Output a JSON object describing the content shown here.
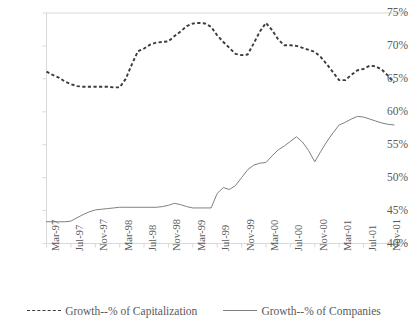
{
  "chart_data": {
    "type": "line",
    "title": "",
    "xlabel": "",
    "ylabel": "",
    "ylim": [
      40,
      75
    ],
    "ytick_labels": [
      "75%",
      "70%",
      "65%",
      "60%",
      "55%",
      "50%",
      "45%",
      "40%"
    ],
    "ytick_values": [
      75,
      70,
      65,
      60,
      55,
      50,
      45,
      40
    ],
    "grid": false,
    "legend_position": "bottom",
    "x": [
      "Mar-97",
      "Apr-97",
      "May-97",
      "Jun-97",
      "Jul-97",
      "Aug-97",
      "Sep-97",
      "Oct-97",
      "Nov-97",
      "Dec-97",
      "Jan-98",
      "Feb-98",
      "Mar-98",
      "Apr-98",
      "May-98",
      "Jun-98",
      "Jul-98",
      "Aug-98",
      "Sep-98",
      "Oct-98",
      "Nov-98",
      "Dec-98",
      "Jan-99",
      "Feb-99",
      "Mar-99",
      "Apr-99",
      "May-99",
      "Jun-99",
      "Jul-99",
      "Aug-99",
      "Sep-99",
      "Oct-99",
      "Nov-99",
      "Dec-99",
      "Jan-00",
      "Feb-00",
      "Mar-00",
      "Apr-00",
      "May-00",
      "Jun-00",
      "Jul-00",
      "Aug-00",
      "Sep-00",
      "Oct-00",
      "Nov-00",
      "Dec-00",
      "Jan-01",
      "Feb-01",
      "Mar-01",
      "Apr-01",
      "May-01",
      "Jun-01",
      "Jul-01",
      "Aug-01",
      "Sep-01",
      "Oct-01",
      "Nov-01",
      "Dec-01"
    ],
    "xtick_labels": [
      "Mar-97",
      "Jul-97",
      "Nov-97",
      "Mar-98",
      "Jul-98",
      "Nov-98",
      "Mar-99",
      "Jul-99",
      "Nov-99",
      "Mar-00",
      "Jul-00",
      "Nov-00",
      "Mar-01",
      "Jul-01",
      "Nov-01"
    ],
    "xtick_indices": [
      0,
      4,
      8,
      12,
      16,
      20,
      24,
      28,
      32,
      36,
      40,
      44,
      48,
      52,
      56
    ],
    "series": [
      {
        "name": "Growth--% of Capitalization",
        "style": "dashed",
        "color": "#3b3b3b",
        "values": [
          66.1,
          65.6,
          65.2,
          64.6,
          64.2,
          63.9,
          63.8,
          63.8,
          63.8,
          63.8,
          63.8,
          63.7,
          63.7,
          65.0,
          67.2,
          69.2,
          69.6,
          70.2,
          70.5,
          70.6,
          70.7,
          71.5,
          72.2,
          73.0,
          73.4,
          73.5,
          73.4,
          72.9,
          71.6,
          70.6,
          69.7,
          68.8,
          68.6,
          68.7,
          70.4,
          72.2,
          73.5,
          72.4,
          71.0,
          70.1,
          70.1,
          70.0,
          69.7,
          69.4,
          69.1,
          68.3,
          67.2,
          66.0,
          64.8,
          64.8,
          65.6,
          66.3,
          66.5,
          67.0,
          66.9,
          66.4,
          65.5,
          64.4
        ]
      },
      {
        "name": "Growth--% of Companies",
        "style": "solid",
        "color": "#808080",
        "values": [
          43.3,
          43.3,
          43.3,
          43.3,
          43.4,
          43.9,
          44.4,
          44.8,
          45.1,
          45.2,
          45.3,
          45.4,
          45.5,
          45.5,
          45.5,
          45.5,
          45.5,
          45.5,
          45.5,
          45.6,
          45.8,
          46.1,
          45.9,
          45.6,
          45.4,
          45.4,
          45.4,
          45.4,
          47.6,
          48.5,
          48.2,
          48.8,
          50.0,
          51.2,
          51.9,
          52.2,
          52.3,
          53.3,
          54.2,
          54.8,
          55.5,
          56.2,
          55.4,
          54.1,
          52.4,
          54.0,
          55.5,
          56.8,
          58.0,
          58.4,
          58.9,
          59.3,
          59.2,
          58.9,
          58.6,
          58.3,
          58.1,
          58.0
        ]
      }
    ]
  },
  "legend": {
    "items": [
      {
        "label": "Growth--% of Capitalization",
        "style": "dashed"
      },
      {
        "label": "Growth--% of Companies",
        "style": "solid"
      }
    ]
  }
}
